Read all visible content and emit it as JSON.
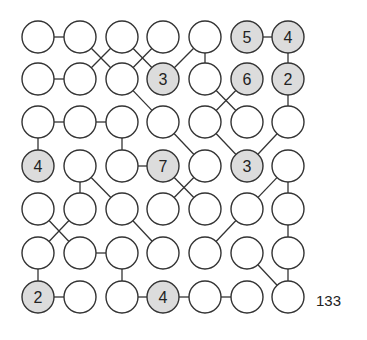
{
  "puzzle": {
    "id_label": "133",
    "grid": {
      "rows": 7,
      "cols": 7
    },
    "col_x": [
      38,
      80,
      122,
      163,
      205,
      247,
      288
    ],
    "row_y": [
      37,
      79,
      122,
      166,
      209,
      253,
      297
    ],
    "radius": 16,
    "colors": {
      "stroke": "#333333",
      "empty_fill": "#ffffff",
      "clue_fill": "#dcdcdc",
      "text": "#222222"
    },
    "clues": [
      {
        "r": 0,
        "c": 5,
        "value": "5"
      },
      {
        "r": 0,
        "c": 6,
        "value": "4"
      },
      {
        "r": 1,
        "c": 3,
        "value": "3"
      },
      {
        "r": 1,
        "c": 5,
        "value": "6"
      },
      {
        "r": 1,
        "c": 6,
        "value": "2"
      },
      {
        "r": 3,
        "c": 0,
        "value": "4"
      },
      {
        "r": 3,
        "c": 3,
        "value": "7"
      },
      {
        "r": 3,
        "c": 5,
        "value": "3"
      },
      {
        "r": 6,
        "c": 0,
        "value": "2"
      },
      {
        "r": 6,
        "c": 3,
        "value": "4"
      }
    ],
    "edges": [
      [
        [
          0,
          0
        ],
        [
          0,
          1
        ]
      ],
      [
        [
          0,
          1
        ],
        [
          1,
          2
        ]
      ],
      [
        [
          0,
          2
        ],
        [
          1,
          1
        ]
      ],
      [
        [
          0,
          2
        ],
        [
          1,
          3
        ]
      ],
      [
        [
          0,
          3
        ],
        [
          1,
          2
        ]
      ],
      [
        [
          0,
          4
        ],
        [
          1,
          3
        ]
      ],
      [
        [
          0,
          4
        ],
        [
          1,
          4
        ]
      ],
      [
        [
          0,
          5
        ],
        [
          0,
          6
        ]
      ],
      [
        [
          0,
          6
        ],
        [
          1,
          6
        ]
      ],
      [
        [
          1,
          0
        ],
        [
          1,
          1
        ]
      ],
      [
        [
          1,
          2
        ],
        [
          2,
          3
        ]
      ],
      [
        [
          1,
          4
        ],
        [
          2,
          5
        ]
      ],
      [
        [
          1,
          5
        ],
        [
          2,
          4
        ]
      ],
      [
        [
          1,
          6
        ],
        [
          2,
          6
        ]
      ],
      [
        [
          2,
          0
        ],
        [
          2,
          1
        ]
      ],
      [
        [
          2,
          1
        ],
        [
          2,
          2
        ]
      ],
      [
        [
          2,
          0
        ],
        [
          3,
          0
        ]
      ],
      [
        [
          2,
          2
        ],
        [
          3,
          2
        ]
      ],
      [
        [
          2,
          3
        ],
        [
          3,
          4
        ]
      ],
      [
        [
          2,
          4
        ],
        [
          3,
          5
        ]
      ],
      [
        [
          2,
          6
        ],
        [
          3,
          5
        ]
      ],
      [
        [
          3,
          2
        ],
        [
          3,
          3
        ]
      ],
      [
        [
          3,
          1
        ],
        [
          4,
          1
        ]
      ],
      [
        [
          3,
          1
        ],
        [
          4,
          2
        ]
      ],
      [
        [
          3,
          3
        ],
        [
          4,
          4
        ]
      ],
      [
        [
          3,
          4
        ],
        [
          4,
          3
        ]
      ],
      [
        [
          3,
          6
        ],
        [
          4,
          5
        ]
      ],
      [
        [
          3,
          6
        ],
        [
          4,
          6
        ]
      ],
      [
        [
          4,
          0
        ],
        [
          5,
          1
        ]
      ],
      [
        [
          4,
          1
        ],
        [
          5,
          0
        ]
      ],
      [
        [
          4,
          2
        ],
        [
          5,
          3
        ]
      ],
      [
        [
          4,
          5
        ],
        [
          5,
          4
        ]
      ],
      [
        [
          4,
          6
        ],
        [
          5,
          6
        ]
      ],
      [
        [
          5,
          1
        ],
        [
          5,
          2
        ]
      ],
      [
        [
          5,
          0
        ],
        [
          6,
          0
        ]
      ],
      [
        [
          5,
          2
        ],
        [
          6,
          2
        ]
      ],
      [
        [
          5,
          5
        ],
        [
          6,
          6
        ]
      ],
      [
        [
          5,
          6
        ],
        [
          6,
          6
        ]
      ],
      [
        [
          6,
          0
        ],
        [
          6,
          1
        ]
      ],
      [
        [
          6,
          2
        ],
        [
          6,
          3
        ]
      ],
      [
        [
          6,
          3
        ],
        [
          6,
          4
        ]
      ],
      [
        [
          6,
          4
        ],
        [
          6,
          5
        ]
      ]
    ]
  }
}
